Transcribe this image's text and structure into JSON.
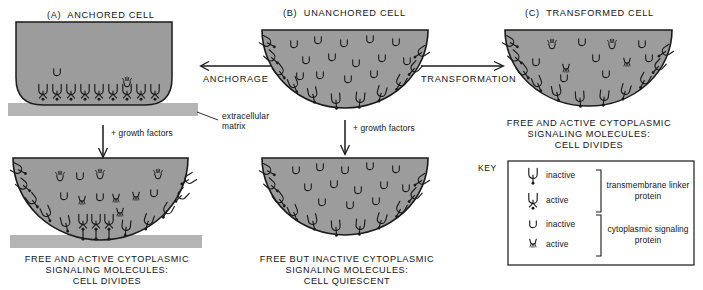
{
  "figure": {
    "title_a": "(A)  ANCHORED CELL",
    "title_b": "(B)  UNANCHORED CELL",
    "title_c": "(C)  TRANSFORMED CELL"
  },
  "arrows": {
    "anchorage_label": "ANCHORAGE",
    "transformation_label": "TRANSFORMATION",
    "growth_factors_left": "+ growth factors",
    "growth_factors_middle": "+ growth factors"
  },
  "annotations": {
    "extracellular_matrix": "extracellular\nmatrix"
  },
  "captions": {
    "bottom_left": [
      "FREE AND ACTIVE CYTOPLASMIC",
      "SIGNALING MOLECULES:",
      "CELL DIVIDES"
    ],
    "bottom_middle": [
      "FREE BUT INACTIVE CYTOPLASMIC",
      "SIGNALING MOLECULES:",
      "CELL QUIESCENT"
    ],
    "panel_c": [
      "FREE AND ACTIVE CYTOPLASMIC",
      "SIGNALING MOLECULES:",
      "CELL DIVIDES"
    ]
  },
  "key": {
    "heading": "KEY",
    "items": [
      {
        "icon": "linker-inactive-icon",
        "label": "inactive"
      },
      {
        "icon": "linker-active-icon",
        "label": "active"
      },
      {
        "icon": "signaling-inactive-icon",
        "label": "inactive"
      },
      {
        "icon": "signaling-active-icon",
        "label": "active"
      }
    ],
    "groups": [
      {
        "name": "transmembrane-linker-protein",
        "line1": "transmembrane linker",
        "line2": "protein"
      },
      {
        "name": "cytoplasmic-signaling-protein",
        "line1": "cytoplasmic signaling",
        "line2": "protein"
      }
    ]
  },
  "colors": {
    "cytoplasm_fill": "#9c9c9c",
    "matrix_fill": "#b4b4b4",
    "outline": "#1a1a1a",
    "background": "#ffffff",
    "text": "#141414"
  }
}
